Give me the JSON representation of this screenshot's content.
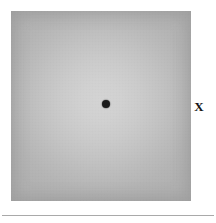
{
  "figure": {
    "type": "visual-perception-stimulus",
    "caption": "",
    "background_color": "#ffffff"
  },
  "stimulus": {
    "label": "",
    "shape": "square",
    "x": 11,
    "y": 11,
    "width": 180,
    "height": 190,
    "center_color": "#d4d4d4",
    "edge_color": "#b1b1b1",
    "gradient": "radial",
    "description": "gray square patch with lighter center"
  },
  "markers": {
    "fixation_dot": {
      "name": "fixation-dot",
      "symbol": "●",
      "color": "#1b1b1b",
      "x": 106,
      "y": 104,
      "diameter": 8
    },
    "x_marker": {
      "name": "x-marker",
      "symbol": "X",
      "label": "X",
      "color": "#161616",
      "x": 199,
      "y": 107
    }
  },
  "rule": {
    "name": "bottom-rule",
    "color": "#a9a9a9",
    "y": 215,
    "width": 212
  }
}
